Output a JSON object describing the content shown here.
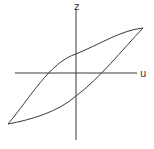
{
  "diagram": {
    "type": "hysteresis-loop",
    "axes": {
      "vertical_label": "z",
      "horizontal_label": "u"
    },
    "colors": {
      "line": "#3a3a3a",
      "background": "#ffffff"
    }
  }
}
